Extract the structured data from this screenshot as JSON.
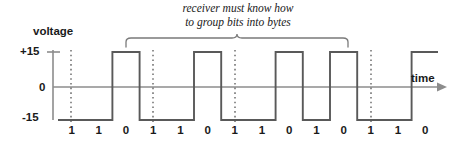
{
  "figure": {
    "kind": "signal-timing-diagram",
    "axis": {
      "y_label": "voltage",
      "x_label": "time",
      "ticks": [
        {
          "name": "plus15",
          "label": "+15",
          "value": 15
        },
        {
          "name": "zero",
          "label": "0",
          "value": 0
        },
        {
          "name": "minus15",
          "label": "-15",
          "value": -15
        }
      ]
    },
    "annotation": {
      "line1": "receiver must know how",
      "line2": "to group bits into bytes"
    },
    "colors": {
      "waveform": "#595959",
      "axis": "#8c8c8c",
      "text": "#1a1a1a",
      "brace": "#7a7a7a",
      "dotted": "#6e6e6e",
      "background": "#ffffff"
    }
  },
  "chart_data": {
    "type": "line",
    "title": "",
    "subtitle": "receiver must know how to group bits into bytes",
    "xlabel": "time",
    "ylabel": "voltage",
    "ylim": [
      -15,
      15
    ],
    "grid": false,
    "legend": null,
    "encoding": {
      "note": "RS-232 style: logical 1 = -15 V (low), logical 0 = +15 V (high)",
      "bit_1_voltage": -15,
      "bit_0_voltage": 15
    },
    "categories": [
      "1",
      "1",
      "0",
      "1",
      "1",
      "0",
      "1",
      "1",
      "0",
      "1",
      "0",
      "1",
      "1",
      "0"
    ],
    "values": [
      -15,
      -15,
      15,
      -15,
      -15,
      15,
      -15,
      -15,
      15,
      -15,
      15,
      -15,
      -15,
      15
    ],
    "series": [
      {
        "name": "signal",
        "bits": [
          "1",
          "1",
          "0",
          "1",
          "1",
          "0",
          "1",
          "1",
          "0",
          "1",
          "0",
          "1",
          "1",
          "0"
        ],
        "values": [
          -15,
          -15,
          15,
          -15,
          -15,
          15,
          -15,
          -15,
          15,
          -15,
          15,
          -15,
          -15,
          15
        ]
      }
    ],
    "byte_boundaries": [
      1.5,
      4.5,
      7.5,
      12.5
    ],
    "brace_span_bits": [
      2.5,
      11.5
    ],
    "annotations": [
      {
        "text": "receiver must know how to group bits into bytes",
        "target": "brace"
      }
    ]
  }
}
